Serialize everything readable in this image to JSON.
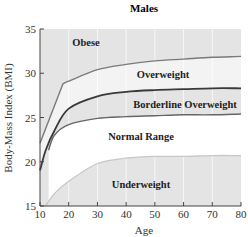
{
  "chart_data": {
    "type": "area",
    "title": "Males",
    "xlabel": "Age",
    "ylabel": "Body-Mass Index (BMI)",
    "xlim": [
      10,
      80
    ],
    "ylim": [
      15,
      35
    ],
    "xticks": [
      10,
      20,
      30,
      40,
      50,
      60,
      70,
      80
    ],
    "yticks": [
      15,
      20,
      25,
      30,
      35
    ],
    "grid": "vertical",
    "series": [
      {
        "name": "Obese / Overweight boundary",
        "x": [
          10,
          18,
          20,
          30,
          40,
          50,
          60,
          70,
          80
        ],
        "values": [
          22.1,
          28.8,
          29.1,
          30.4,
          31.0,
          31.4,
          31.6,
          31.8,
          31.9
        ]
      },
      {
        "name": "Overweight / Borderline boundary",
        "x": [
          10,
          12,
          15,
          20,
          30,
          40,
          50,
          60,
          70,
          80
        ],
        "values": [
          19.0,
          21.3,
          23.5,
          26.0,
          27.4,
          27.9,
          28.1,
          28.2,
          28.3,
          28.3
        ]
      },
      {
        "name": "Borderline / Normal boundary",
        "x": [
          13,
          15,
          20,
          30,
          40,
          50,
          60,
          70,
          80
        ],
        "values": [
          21.3,
          23.0,
          24.2,
          24.9,
          25.1,
          25.2,
          25.3,
          25.3,
          25.4
        ]
      },
      {
        "name": "Normal / Underweight boundary",
        "x": [
          12,
          15,
          20,
          30,
          40,
          50,
          60,
          70,
          80
        ],
        "values": [
          15.0,
          16.4,
          17.8,
          19.8,
          20.4,
          20.6,
          20.6,
          20.7,
          20.7
        ]
      }
    ],
    "regions": [
      "Obese",
      "Overweight",
      "Borderline Overweight",
      "Normal Range",
      "Underweight"
    ]
  },
  "labels": {
    "title": "Males",
    "xlabel": "Age",
    "ylabel": "Body-Mass Index (BMI)",
    "regions": {
      "obese": "Obese",
      "overweight": "Overweight",
      "borderline": "Borderline Overweight",
      "normal": "Normal Range",
      "underweight": "Underweight"
    },
    "xticks": [
      "10",
      "20",
      "30",
      "40",
      "50",
      "60",
      "70",
      "80"
    ],
    "yticks": [
      "15",
      "20",
      "25",
      "30",
      "35"
    ]
  },
  "colors": {
    "gray_band": "#e4e4e4",
    "light_band": "#f3f3f3",
    "white_band": "#ffffff",
    "obese_line": "#7a7a7a",
    "overweight_line": "#3a3a3a",
    "normal_line": "#666666",
    "underweight_line": "#c8c8c8"
  }
}
